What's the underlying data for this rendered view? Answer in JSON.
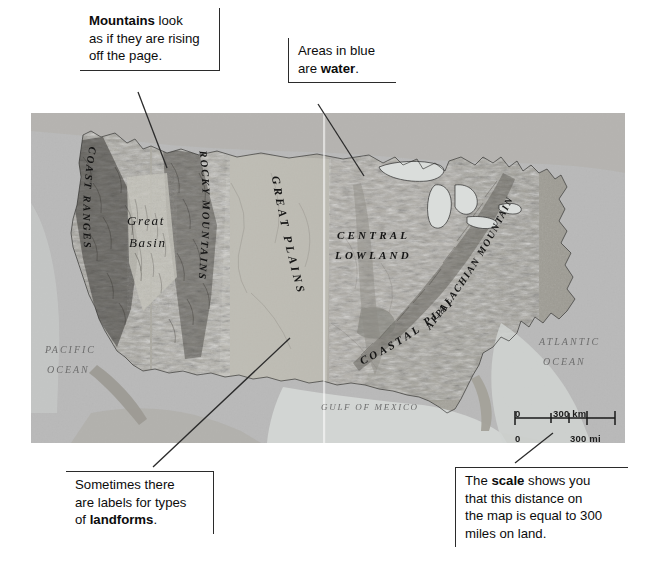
{
  "figure": {
    "map_type": "shaded-relief",
    "colors": {
      "page_background": "#ffffff",
      "map_background": "#b9b9b9",
      "water": "#d4d7d4",
      "land_light": "#cfcdc6",
      "land_mid": "#a9a79f",
      "land_dark": "#6b6a64",
      "callout_border": "#2b2b2b",
      "leader_line": "#2b2b2b",
      "text": "#0c0c0c"
    }
  },
  "callouts": [
    {
      "id": "mountains",
      "name": "callout-mountains",
      "lines": [
        [
          {
            "t": "Mountains",
            "b": true
          },
          {
            "t": " look",
            "b": false
          }
        ],
        [
          {
            "t": "as if they are rising",
            "b": false
          }
        ],
        [
          {
            "t": "off the page.",
            "b": false
          }
        ]
      ]
    },
    {
      "id": "water",
      "name": "callout-water",
      "lines": [
        [
          {
            "t": "Areas in blue",
            "b": false
          }
        ],
        [
          {
            "t": "are ",
            "b": false
          },
          {
            "t": "water",
            "b": true
          },
          {
            "t": ".",
            "b": false
          }
        ]
      ]
    },
    {
      "id": "landforms",
      "name": "callout-landforms",
      "lines": [
        [
          {
            "t": "Sometimes there",
            "b": false
          }
        ],
        [
          {
            "t": "are labels for types",
            "b": false
          }
        ],
        [
          {
            "t": "of ",
            "b": false
          },
          {
            "t": "landforms",
            "b": true
          },
          {
            "t": ".",
            "b": false
          }
        ]
      ]
    },
    {
      "id": "scale",
      "name": "callout-scale",
      "lines": [
        [
          {
            "t": "The ",
            "b": false
          },
          {
            "t": "scale",
            "b": true
          },
          {
            "t": " shows you",
            "b": false
          }
        ],
        [
          {
            "t": "that this distance on",
            "b": false
          }
        ],
        [
          {
            "t": "the map is equal to 300",
            "b": false
          }
        ],
        [
          {
            "t": "miles on land.",
            "b": false
          }
        ]
      ]
    }
  ],
  "map_labels": {
    "regions": [
      {
        "text": "COAST RANGES",
        "style": "all-caps-italic-curved",
        "region": "west-coast"
      },
      {
        "text": "Great",
        "style": "title-case-italic",
        "region": "great-basin-line1"
      },
      {
        "text": "Basin",
        "style": "title-case-italic",
        "region": "great-basin-line2"
      },
      {
        "text": "ROCKY MOUNTAINS",
        "style": "all-caps-italic-vertical",
        "region": "rockies"
      },
      {
        "text": "GREAT PLAINS",
        "style": "all-caps-italic-diagonal",
        "region": "great-plains"
      },
      {
        "text": "CENTRAL",
        "style": "all-caps-italic",
        "region": "central-lowland-line1"
      },
      {
        "text": "LOWLAND",
        "style": "all-caps-italic",
        "region": "central-lowland-line2"
      },
      {
        "text": "APPALACHIAN MOUNTAINS",
        "style": "all-caps-italic-diagonal",
        "region": "appalachians"
      },
      {
        "text": "COASTAL PLAIN",
        "style": "all-caps-italic-diagonal",
        "region": "coastal-plain"
      }
    ],
    "water_bodies": [
      {
        "text": "PACIFIC",
        "style": "serif-italic-caps",
        "region": "pacific-line1"
      },
      {
        "text": "OCEAN",
        "style": "serif-italic-caps",
        "region": "pacific-line2"
      },
      {
        "text": "ATLANTIC",
        "style": "serif-italic-caps",
        "region": "atlantic-line1"
      },
      {
        "text": "OCEAN",
        "style": "serif-italic-caps",
        "region": "atlantic-line2"
      },
      {
        "text": "GULF OF MEXICO",
        "style": "serif-italic-caps",
        "region": "gulf"
      }
    ]
  },
  "scale_bar": {
    "name": "map-scale-bar",
    "top_zero": "0",
    "top_value": "300 km",
    "bottom_zero": "0",
    "bottom_value": "300 mi"
  }
}
